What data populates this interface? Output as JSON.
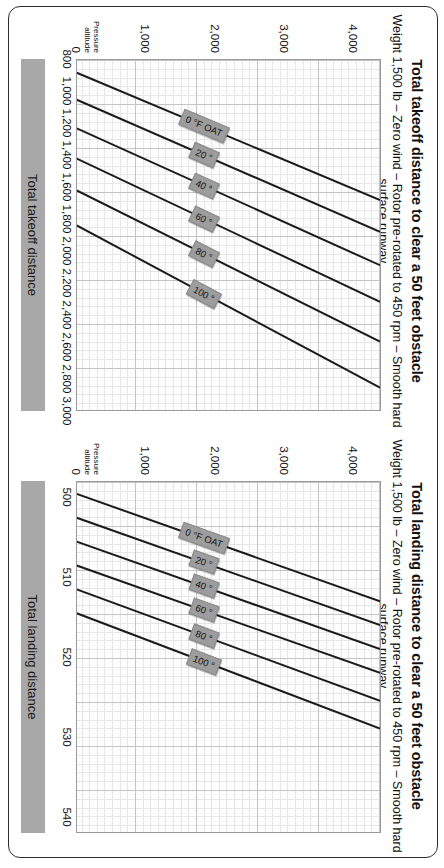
{
  "page": {
    "orientation": "landscape-rotated-90",
    "background": "#ffffff",
    "border_color": "#2c2c2c",
    "band_color": "#a8a8a8",
    "label_color": "#9d9d9d",
    "line_color": "#1a1a1a"
  },
  "charts": [
    {
      "id": "takeoff",
      "title": "Total takeoff distance to clear a 50 feet obstacle",
      "subtitle": "Weight 1,500 lb – Zero wind – Rotor pre-rotated to 450 rpm – Smooth hard surface runway",
      "x_axis_caption": "Total takeoff distance",
      "y_axis_caption": "Pressure altitude",
      "x_ticks": [
        "800",
        "1,000",
        "1,200",
        "1,400",
        "1,600",
        "1,800",
        "2,000",
        "2,200",
        "2,400",
        "2,600",
        "2,800",
        "3,000"
      ],
      "y_ticks": [
        "0",
        "1,000",
        "2,000",
        "3,000",
        "4,000"
      ],
      "oat_labels": [
        "0 °F OAT",
        "20 °",
        "40 °",
        "60 °",
        "80 °",
        "100 °"
      ]
    },
    {
      "id": "landing",
      "title": "Total landing distance to clear a 50 feet obstacle",
      "subtitle": "Weight 1,500 lb – Zero wind – Rotor pre-rotated to 450 rpm – Smooth hard surface runway",
      "x_axis_caption": "Total landing distance",
      "y_axis_caption": "Pressure altitude",
      "x_ticks": [
        "500",
        "510",
        "520",
        "530",
        "540"
      ],
      "y_ticks": [
        "0",
        "1,000",
        "2,000",
        "3,000",
        "4,000"
      ],
      "oat_labels": [
        "0 °F OAT",
        "20 °",
        "40 °",
        "60 °",
        "80 °",
        "100 °"
      ]
    }
  ],
  "chart_data": [
    {
      "type": "line",
      "id": "takeoff",
      "title": "Total takeoff distance to clear a 50 feet obstacle",
      "subtitle": "Weight 1,500 lb – Zero wind – Rotor pre-rotated to 450 rpm – Smooth hard surface runway",
      "xlabel": "Total takeoff distance",
      "ylabel": "Pressure altitude",
      "xlim": [
        800,
        3000
      ],
      "ylim": [
        0,
        4400
      ],
      "xticks": [
        800,
        1000,
        1200,
        1400,
        1600,
        1800,
        2000,
        2200,
        2400,
        2600,
        2800,
        3000
      ],
      "yticks": [
        0,
        1000,
        2000,
        3000,
        4000
      ],
      "grid": true,
      "legend": "inline-curve-labels",
      "series": [
        {
          "name": "0 °F OAT",
          "x": [
            880,
            1680
          ],
          "y": [
            0,
            4400
          ]
        },
        {
          "name": "20 °",
          "x": [
            1050,
            1880
          ],
          "y": [
            0,
            4400
          ]
        },
        {
          "name": "40 °",
          "x": [
            1230,
            2090
          ],
          "y": [
            0,
            4400
          ]
        },
        {
          "name": "60 °",
          "x": [
            1420,
            2320
          ],
          "y": [
            0,
            4400
          ]
        },
        {
          "name": "80 °",
          "x": [
            1620,
            2570
          ],
          "y": [
            0,
            4400
          ]
        },
        {
          "name": "100 °",
          "x": [
            1840,
            2860
          ],
          "y": [
            0,
            4400
          ]
        }
      ]
    },
    {
      "type": "line",
      "id": "landing",
      "title": "Total landing distance to clear a 50 feet obstacle",
      "subtitle": "Weight 1,500 lb – Zero wind – Rotor pre-rotated to 450 rpm – Smooth hard surface runway",
      "xlabel": "Total landing distance",
      "ylabel": "Pressure altitude",
      "xlim": [
        498,
        542
      ],
      "ylim": [
        0,
        4400
      ],
      "xticks": [
        500,
        510,
        520,
        530,
        540
      ],
      "yticks": [
        0,
        1000,
        2000,
        3000,
        4000
      ],
      "grid": true,
      "legend": "inline-curve-labels",
      "series": [
        {
          "name": "0 °F OAT",
          "x": [
            499.5,
            513.0
          ],
          "y": [
            0,
            4400
          ]
        },
        {
          "name": "20 °",
          "x": [
            502.5,
            516.0
          ],
          "y": [
            0,
            4400
          ]
        },
        {
          "name": "40 °",
          "x": [
            505.5,
            519.0
          ],
          "y": [
            0,
            4400
          ]
        },
        {
          "name": "60 °",
          "x": [
            508.5,
            522.0
          ],
          "y": [
            0,
            4400
          ]
        },
        {
          "name": "80 °",
          "x": [
            511.5,
            525.5
          ],
          "y": [
            0,
            4400
          ]
        },
        {
          "name": "100 °",
          "x": [
            514.5,
            529.0
          ],
          "y": [
            0,
            4400
          ]
        }
      ]
    }
  ]
}
